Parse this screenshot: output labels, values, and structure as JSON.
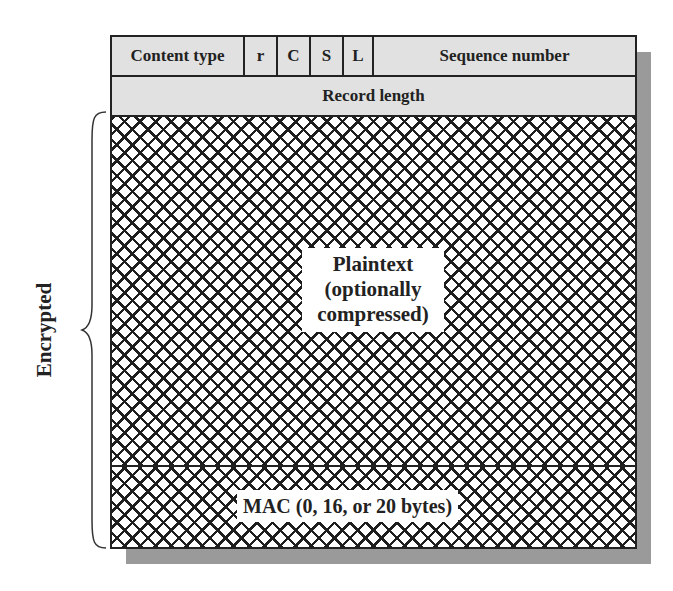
{
  "diagram": {
    "header_row_1": [
      {
        "key": "content_type",
        "label": "Content type"
      },
      {
        "key": "r",
        "label": "r"
      },
      {
        "key": "c",
        "label": "C"
      },
      {
        "key": "s",
        "label": "S"
      },
      {
        "key": "l",
        "label": "L"
      },
      {
        "key": "sequence_number",
        "label": "Sequence number"
      }
    ],
    "header_row_2": {
      "label": "Record length"
    },
    "body": {
      "plaintext_label": "Plaintext (optionally compressed)",
      "plaintext_lines": [
        "Plaintext",
        "(optionally",
        "compressed)"
      ],
      "mac_label": "MAC (0, 16, or 20 bytes)"
    },
    "brace_label": "Encrypted",
    "colors": {
      "header_fill": "#e1e1e1",
      "border": "#222222",
      "hatch": "#1e1e1e",
      "shadow": "#9a9a9a"
    }
  }
}
